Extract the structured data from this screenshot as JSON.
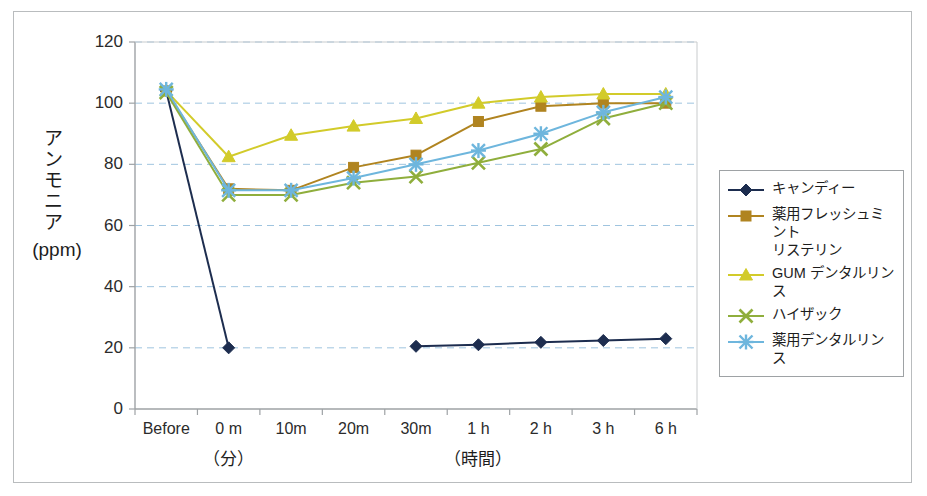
{
  "chart_data": {
    "type": "line",
    "title": "",
    "xlabel": "",
    "ylabel": "アンモニア (ppm)",
    "ylabel_vertical": "アンモニア",
    "ylabel_units": "(ppm)",
    "categories": [
      "Before",
      "0 m",
      "10m",
      "20m",
      "30m",
      "1 h",
      "2 h",
      "3 h",
      "6 h"
    ],
    "x_group_labels": [
      {
        "text": "（分）",
        "center_category": "0 m"
      },
      {
        "text": "（時間）",
        "center_category": "1 h"
      }
    ],
    "ylim": [
      0,
      120
    ],
    "ytick_labels": [
      "0",
      "20",
      "40",
      "60",
      "80",
      "100",
      "120"
    ],
    "ytick_values": [
      0,
      20,
      40,
      60,
      80,
      100,
      120
    ],
    "grid": "horizontal-dashed",
    "legend_position": "right",
    "series": [
      {
        "name": "キャンディー",
        "color": "#1d2d4f",
        "marker": "diamond",
        "values": [
          104,
          20,
          null,
          null,
          20.5,
          21,
          21.8,
          22.4,
          23
        ]
      },
      {
        "name": "薬用フレッシュミント\nリステリン",
        "color": "#b08420",
        "marker": "square",
        "values": [
          104,
          72,
          71.5,
          79,
          83,
          94,
          99,
          100,
          100
        ]
      },
      {
        "name": "GUM デンタルリンス",
        "color": "#d2cb2a",
        "marker": "triangle",
        "values": [
          104,
          82.5,
          89.5,
          92.5,
          95,
          100,
          102,
          103,
          103
        ]
      },
      {
        "name": "ハイザック",
        "color": "#8fae3c",
        "marker": "cross",
        "values": [
          103.5,
          70,
          70,
          74,
          76,
          80.5,
          85,
          95,
          100
        ]
      },
      {
        "name": "薬用デンタルリンス",
        "color": "#6eb6dd",
        "marker": "asterisk",
        "values": [
          104.5,
          71.5,
          71.5,
          75.5,
          80,
          84.5,
          90,
          97,
          102
        ]
      }
    ]
  },
  "colors": {
    "outer_frame": "#b9bcbe",
    "plot_border": "#9ea2a5",
    "gridline": "#9fc4df",
    "axis_text": "#2b2b2b",
    "background": "#ffffff"
  }
}
